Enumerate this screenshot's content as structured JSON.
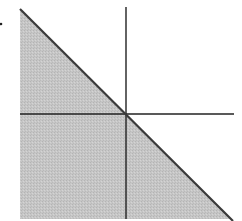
{
  "diagram": {
    "colors": {
      "background": "#ffffff",
      "shade": "#c8c8c8",
      "boundary_line": "#3a3a3a",
      "axes": "#222222",
      "dot": "#222222"
    },
    "shaded_region": {
      "points": "20,9 20,219 231,219"
    },
    "boundary_line": {
      "x1": 20,
      "y1": 9,
      "x2": 233,
      "y2": 221
    },
    "x_axis": {
      "x1": 20,
      "y1": 114,
      "x2": 234,
      "y2": 114
    },
    "y_axis": {
      "x1": 126,
      "y1": 7,
      "x2": 126,
      "y2": 219
    },
    "dot": {
      "cx": 1,
      "cy": 24,
      "r": 1.3
    }
  }
}
